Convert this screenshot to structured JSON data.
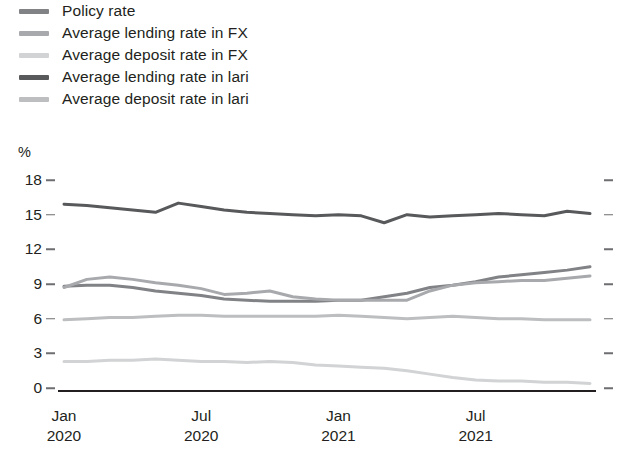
{
  "legend": {
    "position": "top-left",
    "items": [
      {
        "label": "Policy rate",
        "color": "#808285",
        "key": "policy_rate"
      },
      {
        "label": "Average lending rate in FX",
        "color": "#a7a9ac",
        "key": "lending_fx"
      },
      {
        "label": "Average deposit rate in FX",
        "color": "#d1d3d4",
        "key": "deposit_fx"
      },
      {
        "label": "Average lending rate in lari",
        "color": "#58595b",
        "key": "lending_lari"
      },
      {
        "label": "Average deposit rate in lari",
        "color": "#bcbec0",
        "key": "deposit_lari"
      }
    ]
  },
  "axes": {
    "y_unit": "%",
    "y_ticks": [
      "18",
      "15",
      "12",
      "9",
      "6",
      "3",
      "0"
    ],
    "x_ticks": [
      {
        "month": "Jan",
        "year": "2020"
      },
      {
        "month": "Jul",
        "year": "2020"
      },
      {
        "month": "Jan",
        "year": "2021"
      },
      {
        "month": "Jul",
        "year": "2021"
      }
    ]
  },
  "chart_data": {
    "type": "line",
    "title": "",
    "xlabel": "",
    "ylabel": "%",
    "ylim": [
      0,
      18
    ],
    "y_ticks": [
      0,
      3,
      6,
      9,
      12,
      15,
      18
    ],
    "grid": false,
    "legend_position": "top-left",
    "x": [
      "Jan 2020",
      "Feb 2020",
      "Mar 2020",
      "Apr 2020",
      "May 2020",
      "Jun 2020",
      "Jul 2020",
      "Aug 2020",
      "Sep 2020",
      "Oct 2020",
      "Nov 2020",
      "Dec 2020",
      "Jan 2021",
      "Feb 2021",
      "Mar 2021",
      "Apr 2021",
      "May 2021",
      "Jun 2021",
      "Jul 2021",
      "Aug 2021",
      "Sep 2021",
      "Oct 2021",
      "Nov 2021",
      "Dec 2021"
    ],
    "series": [
      {
        "name": "Average lending rate in lari",
        "color": "#58595b",
        "values": [
          15.9,
          15.8,
          15.6,
          15.4,
          15.2,
          16.0,
          15.7,
          15.4,
          15.2,
          15.1,
          15.0,
          14.9,
          15.0,
          14.9,
          14.3,
          15.0,
          14.8,
          14.9,
          15.0,
          15.1,
          15.0,
          14.9,
          15.3,
          15.1
        ]
      },
      {
        "name": "Policy rate",
        "color": "#808285",
        "values": [
          8.8,
          8.9,
          8.9,
          8.7,
          8.4,
          8.2,
          8.0,
          7.7,
          7.6,
          7.5,
          7.5,
          7.5,
          7.6,
          7.6,
          7.9,
          8.2,
          8.7,
          8.9,
          9.2,
          9.6,
          9.8,
          10.0,
          10.2,
          10.5
        ]
      },
      {
        "name": "Average lending rate in FX",
        "color": "#a7a9ac",
        "values": [
          8.7,
          9.4,
          9.6,
          9.4,
          9.1,
          8.9,
          8.6,
          8.1,
          8.2,
          8.4,
          7.9,
          7.7,
          7.6,
          7.6,
          7.6,
          7.6,
          8.4,
          8.9,
          9.1,
          9.2,
          9.3,
          9.3,
          9.5,
          9.7
        ]
      },
      {
        "name": "Average deposit rate in lari",
        "color": "#bcbec0",
        "values": [
          5.9,
          6.0,
          6.1,
          6.1,
          6.2,
          6.3,
          6.3,
          6.2,
          6.2,
          6.2,
          6.2,
          6.2,
          6.3,
          6.2,
          6.1,
          6.0,
          6.1,
          6.2,
          6.1,
          6.0,
          6.0,
          5.9,
          5.9,
          5.9
        ]
      },
      {
        "name": "Average deposit rate in FX",
        "color": "#d1d3d4",
        "values": [
          2.3,
          2.3,
          2.4,
          2.4,
          2.5,
          2.4,
          2.3,
          2.3,
          2.2,
          2.3,
          2.2,
          2.0,
          1.9,
          1.8,
          1.7,
          1.5,
          1.2,
          0.9,
          0.7,
          0.6,
          0.6,
          0.5,
          0.5,
          0.4
        ]
      }
    ]
  }
}
